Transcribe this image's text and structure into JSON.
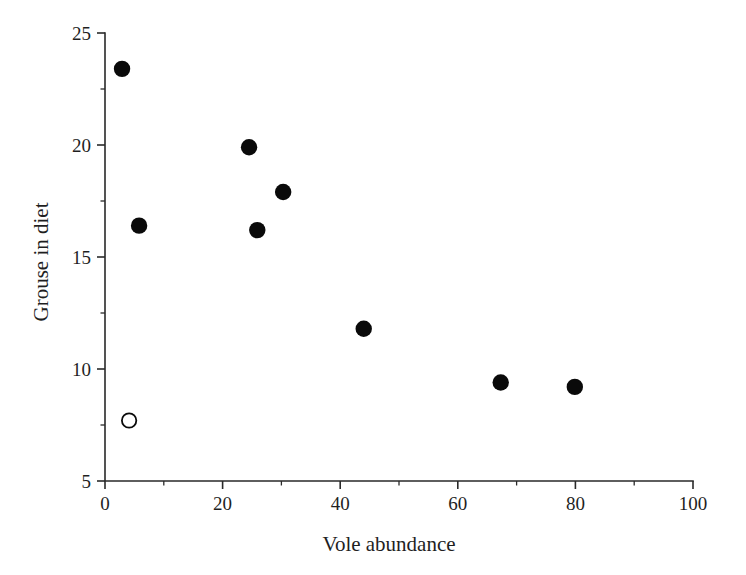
{
  "chart_data": {
    "type": "scatter",
    "title": "",
    "xlabel": "Vole abundance",
    "ylabel": "Grouse in diet",
    "xlim": [
      0,
      100
    ],
    "ylim": [
      5,
      25
    ],
    "xticks": [
      0,
      20,
      40,
      60,
      80,
      100
    ],
    "yticks": [
      5,
      10,
      15,
      20,
      25
    ],
    "xtick_labels": [
      "0",
      "20",
      "40",
      "60",
      "80",
      "100"
    ],
    "ytick_labels": [
      "5",
      "10",
      "15",
      "20",
      "25"
    ],
    "x_minor_ticks": [
      10,
      30,
      50,
      70,
      90
    ],
    "y_minor_ticks": [
      7.5,
      12.5,
      17.5,
      22.5
    ],
    "grid": false,
    "legend": null,
    "series": [
      {
        "name": "filled",
        "marker": "filled-circle",
        "color": "#0a0a0a",
        "points": [
          {
            "x": 2.9,
            "y": 23.4
          },
          {
            "x": 5.8,
            "y": 16.4
          },
          {
            "x": 24.5,
            "y": 19.9
          },
          {
            "x": 30.3,
            "y": 17.9
          },
          {
            "x": 25.9,
            "y": 16.2
          },
          {
            "x": 44.0,
            "y": 11.8
          },
          {
            "x": 67.3,
            "y": 9.4
          },
          {
            "x": 79.9,
            "y": 9.2
          }
        ]
      },
      {
        "name": "open",
        "marker": "open-circle",
        "color": "#ffffff",
        "points": [
          {
            "x": 4.1,
            "y": 7.7
          }
        ]
      }
    ]
  }
}
